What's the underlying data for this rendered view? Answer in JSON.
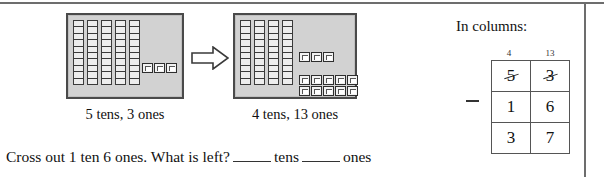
{
  "worksheet": {
    "left_panel": {
      "box_caption": "5 tens, 3 ones",
      "tens_count": 5,
      "ones_count": 3,
      "ones_rows": [
        3
      ]
    },
    "right_panel": {
      "box_caption": "4 tens, 13 ones",
      "tens_count": 4,
      "ones_count": 13,
      "ones_rows": [
        3,
        5,
        5
      ]
    },
    "arrow": {
      "name": "right-arrow",
      "direction": "right"
    },
    "question": {
      "prompt_part1": "Cross out 1 ten 6 ones. What is left?",
      "blank_tens_label": "tens",
      "blank_ones_label": "ones",
      "blank_tens_value": "",
      "blank_ones_value": ""
    },
    "columns_panel": {
      "title": "In columns:",
      "regroup_tens": "4",
      "regroup_ones": "13",
      "operator": "minus",
      "rows": [
        {
          "tens": "5",
          "ones": "3",
          "struck": true
        },
        {
          "tens": "1",
          "ones": "6",
          "struck": false
        },
        {
          "tens": "3",
          "ones": "7",
          "struck": false
        }
      ]
    }
  },
  "colors": {
    "box_fill": "#d2d2d2",
    "box_border": "#4a4a4a",
    "rule": "#6d6d6d",
    "ink": "#111111"
  }
}
